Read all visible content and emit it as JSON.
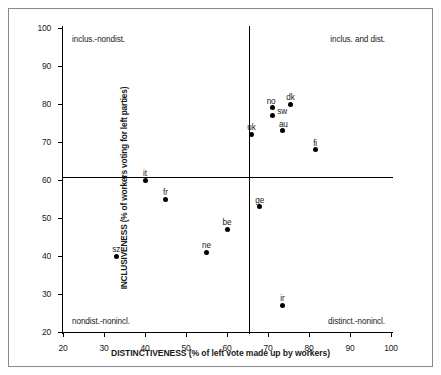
{
  "chart_data": {
    "type": "scatter",
    "title": "",
    "xlabel": "DISTINCTIVENESS (% of left vote made up by workers)",
    "ylabel": "INCLUSIVENESS (% of workers voting for left parties)",
    "xlim": [
      20,
      100
    ],
    "ylim": [
      20,
      100
    ],
    "xticks": [
      20,
      30,
      40,
      50,
      60,
      70,
      80,
      90,
      100
    ],
    "yticks": [
      20,
      30,
      40,
      50,
      60,
      70,
      80,
      90,
      100
    ],
    "grid": false,
    "legend": null,
    "reference_lines": {
      "vertical_x": 65.4,
      "horizontal_y": 60.8
    },
    "annotations": [
      {
        "id": "quad-top-left",
        "text": "inclus.-nondist.",
        "position": "top-left"
      },
      {
        "id": "quad-top-right",
        "text": "inclus. and dist.",
        "position": "top-right"
      },
      {
        "id": "quad-bottom-left",
        "text": "nondist.-nonincl.",
        "position": "bottom-left"
      },
      {
        "id": "quad-bottom-right",
        "text": "distinct.-nonincl.",
        "position": "bottom-right"
      }
    ],
    "points": [
      {
        "label": "sz",
        "x": 33.0,
        "y": 40.0,
        "label_dx": 0,
        "label_dy": -11
      },
      {
        "label": "it",
        "x": 40.0,
        "y": 60.0,
        "label_dx": 0,
        "label_dy": -11
      },
      {
        "label": "fr",
        "x": 45.0,
        "y": 55.0,
        "label_dx": 0,
        "label_dy": -11
      },
      {
        "label": "ne",
        "x": 55.0,
        "y": 41.0,
        "label_dx": 0,
        "label_dy": -11
      },
      {
        "label": "be",
        "x": 60.0,
        "y": 47.0,
        "label_dx": 0,
        "label_dy": -11
      },
      {
        "label": "ge",
        "x": 68.0,
        "y": 53.0,
        "label_dx": 0,
        "label_dy": -11
      },
      {
        "label": "ir",
        "x": 73.5,
        "y": 27.0,
        "label_dx": 0,
        "label_dy": -11
      },
      {
        "label": "uk",
        "x": 66.0,
        "y": 72.0,
        "label_dx": 0,
        "label_dy": -11
      },
      {
        "label": "no",
        "x": 71.0,
        "y": 79.0,
        "label_dx": -1,
        "label_dy": -11
      },
      {
        "label": "sw",
        "x": 71.0,
        "y": 77.0,
        "label_dx": 10,
        "label_dy": -8
      },
      {
        "label": "au",
        "x": 73.5,
        "y": 73.0,
        "label_dx": 1,
        "label_dy": -11
      },
      {
        "label": "dk",
        "x": 75.5,
        "y": 80.0,
        "label_dx": 0,
        "label_dy": -11
      },
      {
        "label": "fi",
        "x": 81.5,
        "y": 68.0,
        "label_dx": 0,
        "label_dy": -11
      }
    ]
  },
  "colors": {
    "point": "#000000",
    "axis": "#000000",
    "frame": "#8a8a8a",
    "background": "#ffffff"
  }
}
